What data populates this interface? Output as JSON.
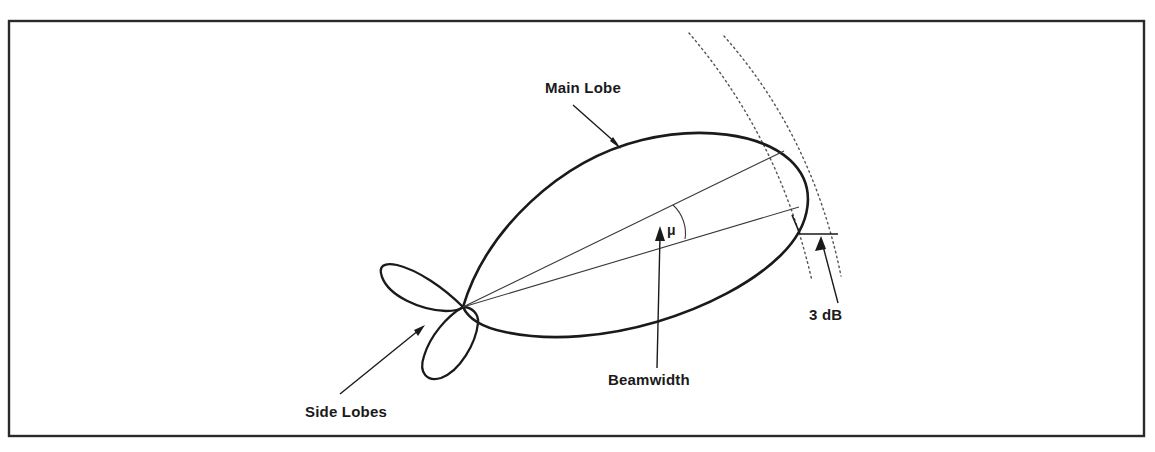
{
  "figure": {
    "background_color": "#ffffff",
    "stroke_color": "#1a1a1a",
    "frame": {
      "x": 8,
      "y": 20,
      "width": 1137,
      "height": 417,
      "color": "#2a2a2a"
    }
  },
  "labels": {
    "main_lobe": "Main Lobe",
    "side_lobes": "Side Lobes",
    "beamwidth": "Beamwidth",
    "angle_symbol": "μ",
    "three_db": "3 dB"
  },
  "geometry": {
    "origin": {
      "x": 463,
      "y": 307
    },
    "main_lobe_tip": {
      "x": 805,
      "y": 185
    },
    "main_lobe_apex_top": {
      "x": 680,
      "y": 139
    },
    "main_lobe_apex_bottom": {
      "x": 600,
      "y": 343
    },
    "upper_ray_end": {
      "x": 784,
      "y": 151
    },
    "lower_ray_end": {
      "x": 799,
      "y": 207
    },
    "side_lobe_left_tip": {
      "x": 382,
      "y": 266
    },
    "side_lobe_lower_tip": {
      "x": 449,
      "y": 378
    }
  },
  "annotations": [
    {
      "name": "main-lobe",
      "text": "Main Lobe",
      "text_x": 545,
      "text_y": 93,
      "arrow_from": {
        "x": 573,
        "y": 105
      },
      "arrow_to": {
        "x": 621,
        "y": 149
      }
    },
    {
      "name": "side-lobes",
      "text": "Side Lobes",
      "text_x": 305,
      "text_y": 417,
      "arrow_from": {
        "x": 340,
        "y": 394
      },
      "arrow_to": {
        "x": 424,
        "y": 326
      }
    },
    {
      "name": "beamwidth",
      "text": "Beamwidth",
      "text_x": 608,
      "text_y": 385,
      "arrow_from": {
        "x": 656,
        "y": 368
      },
      "arrow_to": {
        "x": 660,
        "y": 228
      }
    },
    {
      "name": "three-db",
      "text": "3 dB",
      "text_x": 809,
      "text_y": 320,
      "arrow_from": {
        "x": 838,
        "y": 305
      },
      "arrow_to": {
        "x": 822,
        "y": 238
      }
    }
  ],
  "dotted_arcs": [
    {
      "name": "inner-arc",
      "start": {
        "x": 689,
        "y": 33
      },
      "end": {
        "x": 812,
        "y": 281
      }
    },
    {
      "name": "outer-arc",
      "start": {
        "x": 724,
        "y": 36
      },
      "end": {
        "x": 841,
        "y": 276
      }
    }
  ]
}
